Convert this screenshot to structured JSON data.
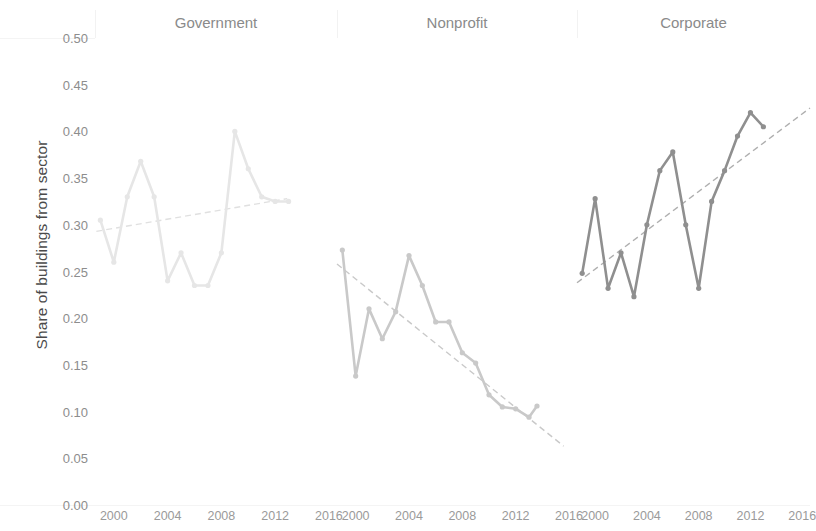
{
  "axis": {
    "ylabel": "Share of buildings from sector",
    "yticks": [
      "0.50",
      "0.45",
      "0.40",
      "0.35",
      "0.30",
      "0.25",
      "0.20",
      "0.15",
      "0.10",
      "0.05",
      "0.00"
    ],
    "ytick_values": [
      0.5,
      0.45,
      0.4,
      0.35,
      0.3,
      0.25,
      0.2,
      0.15,
      0.1,
      0.05,
      0.0
    ],
    "xticks": [
      "2000",
      "2004",
      "2008",
      "2012",
      "2016"
    ],
    "xtick_values": [
      2000,
      2004,
      2008,
      2012,
      2016
    ],
    "ylim": [
      0.0,
      0.5
    ],
    "xlim": [
      1998.6,
      2016.6
    ]
  },
  "panels": [
    {
      "key": "government",
      "title": "Government",
      "color": "#e6e6e6",
      "trend_color": "#e0e0e0"
    },
    {
      "key": "nonprofit",
      "title": "Nonprofit",
      "color": "#c9c9c9",
      "trend_color": "#c9c9c9"
    },
    {
      "key": "corporate",
      "title": "Corporate",
      "color": "#8f8f8f",
      "trend_color": "#b0b0b0"
    }
  ],
  "chart_data": {
    "type": "line",
    "title": "",
    "subtitle": "",
    "xlabel": "",
    "ylabel": "Share of buildings from sector",
    "xlim": [
      1998.6,
      2016.6
    ],
    "ylim": [
      0.0,
      0.5
    ],
    "grid": false,
    "legend": "none",
    "facets": [
      "Government",
      "Nonprofit",
      "Corporate"
    ],
    "marker": "circle",
    "trendline": "linear dashed",
    "series": [
      {
        "name": "Government",
        "facet": "Government",
        "color": "#e6e6e6",
        "x": [
          1999,
          2000,
          2001,
          2002,
          2003,
          2004,
          2005,
          2006,
          2007,
          2008,
          2009,
          2010,
          2011,
          2012,
          2013
        ],
        "values": [
          0.305,
          0.26,
          0.33,
          0.368,
          0.33,
          0.24,
          0.27,
          0.235,
          0.235,
          0.27,
          0.4,
          0.36,
          0.33,
          0.325,
          0.325
        ],
        "trend": {
          "x": [
            1998.7,
            2012.9
          ],
          "y": [
            0.293,
            0.328
          ]
        }
      },
      {
        "name": "Nonprofit",
        "facet": "Nonprofit",
        "color": "#c9c9c9",
        "x": [
          1999,
          2000,
          2001,
          2002,
          2003,
          2004,
          2005,
          2006,
          2007,
          2008,
          2009,
          2010,
          2011,
          2012,
          2013,
          2013.6
        ],
        "values": [
          0.273,
          0.138,
          0.21,
          0.178,
          0.207,
          0.267,
          0.235,
          0.196,
          0.196,
          0.163,
          0.152,
          0.118,
          0.105,
          0.103,
          0.094,
          0.106
        ],
        "trend": {
          "x": [
            1998.6,
            2015.6
          ],
          "y": [
            0.258,
            0.063
          ]
        }
      },
      {
        "name": "Corporate",
        "facet": "Corporate",
        "color": "#8f8f8f",
        "x": [
          1999,
          2000,
          2001,
          2002,
          2003,
          2004,
          2005,
          2006,
          2007,
          2008,
          2009,
          2010,
          2011,
          2012,
          2013
        ],
        "values": [
          0.248,
          0.328,
          0.232,
          0.27,
          0.223,
          0.3,
          0.358,
          0.378,
          0.3,
          0.232,
          0.325,
          0.358,
          0.395,
          0.42,
          0.405
        ],
        "trend": {
          "x": [
            1998.6,
            2016.6
          ],
          "y": [
            0.238,
            0.425
          ]
        }
      }
    ]
  }
}
